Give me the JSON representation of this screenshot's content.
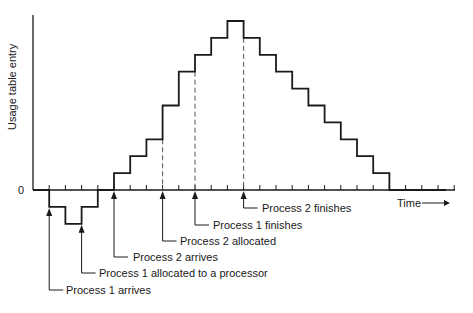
{
  "diagram": {
    "ylabel": "Usage table entry",
    "zero_label": "0",
    "xlabel": "Time",
    "annotations": [
      {
        "id": "p1-arrives",
        "label": "Process 1 arrives",
        "tick": 1
      },
      {
        "id": "p1-allocated",
        "label": "Process 1 allocated to a processor",
        "tick": 3
      },
      {
        "id": "p2-arrives",
        "label": "Process 2 arrives",
        "tick": 5
      },
      {
        "id": "p2-allocated",
        "label": "Process 2 allocated",
        "tick": 8
      },
      {
        "id": "p1-finishes",
        "label": "Process 1 finishes",
        "tick": 10
      },
      {
        "id": "p2-finishes",
        "label": "Process 2 finishes",
        "tick": 13
      }
    ],
    "colors": {
      "line": "#1a1a1a",
      "dashed": "#555555"
    }
  },
  "chart_data": {
    "type": "line",
    "title": "",
    "xlabel": "Time",
    "ylabel": "Usage table entry",
    "step": true,
    "x": [
      0,
      1,
      2,
      3,
      4,
      5,
      6,
      7,
      8,
      9,
      10,
      11,
      12,
      13,
      14,
      15,
      16,
      17,
      18,
      19,
      20,
      21,
      22,
      23,
      24,
      25
    ],
    "values": [
      0,
      -1,
      -2,
      -1,
      0,
      1,
      2,
      3,
      5,
      7,
      8,
      9,
      10,
      9,
      8,
      7,
      6,
      5,
      4,
      3,
      2,
      1,
      0,
      0,
      0,
      0
    ],
    "ylim": [
      -2,
      10
    ],
    "grid": false,
    "dashed_markers_at_tick": [
      8,
      10,
      13
    ]
  }
}
